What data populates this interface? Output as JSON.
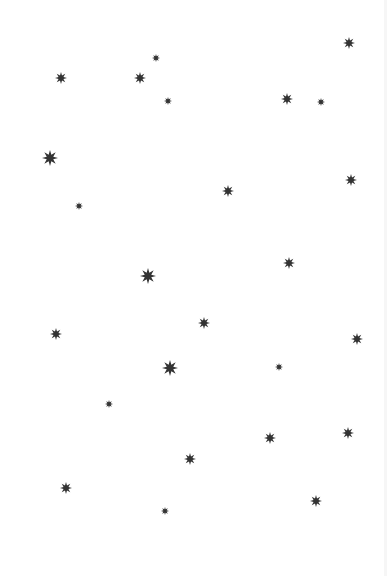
{
  "scene": {
    "background": "#ffffff",
    "star_color": "#333333",
    "star_points": 8,
    "sizes": {
      "small": 8,
      "medium": 12,
      "large": 16
    },
    "stars": [
      {
        "x": 156,
        "y": 58,
        "size": "small"
      },
      {
        "x": 349,
        "y": 43,
        "size": "medium"
      },
      {
        "x": 61,
        "y": 78,
        "size": "medium"
      },
      {
        "x": 140,
        "y": 78,
        "size": "medium"
      },
      {
        "x": 168,
        "y": 101,
        "size": "small"
      },
      {
        "x": 287,
        "y": 99,
        "size": "medium"
      },
      {
        "x": 321,
        "y": 102,
        "size": "small"
      },
      {
        "x": 50,
        "y": 158,
        "size": "large"
      },
      {
        "x": 351,
        "y": 180,
        "size": "medium"
      },
      {
        "x": 228,
        "y": 191,
        "size": "medium"
      },
      {
        "x": 79,
        "y": 206,
        "size": "small"
      },
      {
        "x": 289,
        "y": 263,
        "size": "medium"
      },
      {
        "x": 148,
        "y": 276,
        "size": "large"
      },
      {
        "x": 204,
        "y": 323,
        "size": "medium"
      },
      {
        "x": 56,
        "y": 334,
        "size": "medium"
      },
      {
        "x": 357,
        "y": 339,
        "size": "medium"
      },
      {
        "x": 170,
        "y": 368,
        "size": "large"
      },
      {
        "x": 279,
        "y": 367,
        "size": "small"
      },
      {
        "x": 109,
        "y": 404,
        "size": "small"
      },
      {
        "x": 348,
        "y": 433,
        "size": "medium"
      },
      {
        "x": 270,
        "y": 438,
        "size": "medium"
      },
      {
        "x": 190,
        "y": 459,
        "size": "medium"
      },
      {
        "x": 66,
        "y": 488,
        "size": "medium"
      },
      {
        "x": 165,
        "y": 511,
        "size": "small"
      },
      {
        "x": 316,
        "y": 501,
        "size": "medium"
      }
    ]
  }
}
